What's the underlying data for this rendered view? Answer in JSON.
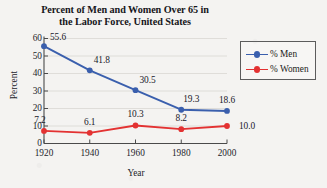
{
  "chart_data": {
    "type": "line",
    "title": "Percent of Men and Women Over 65 in the Labor Force, United States",
    "title_line1": "Percent of Men and Women Over 65 in",
    "title_line2": "the Labor Force, United States",
    "xlabel": "Year",
    "ylabel": "Percent",
    "categories": [
      1920,
      1940,
      1960,
      1980,
      2000
    ],
    "xtick_labels": [
      "1920",
      "1940",
      "1960",
      "1980",
      "2000"
    ],
    "ytick_labels": [
      "0",
      "10",
      "20",
      "30",
      "40",
      "50",
      "60"
    ],
    "ytick_values": [
      0,
      10,
      20,
      30,
      40,
      50,
      60
    ],
    "ylim": [
      0,
      60
    ],
    "xlim": [
      1920,
      2000
    ],
    "grid": "horizontal",
    "legend_position": "right",
    "series": [
      {
        "name": "% Men",
        "color": "#3a5fad",
        "values": [
          55.6,
          41.8,
          30.5,
          19.3,
          18.6
        ],
        "labels": [
          "55.6",
          "41.8",
          "30.5",
          "19.3",
          "18.6"
        ]
      },
      {
        "name": "% Women",
        "color": "#e33232",
        "values": [
          7.2,
          6.1,
          10.3,
          8.2,
          10.0
        ],
        "labels": [
          "7.2",
          "6.1",
          "10.3",
          "8.2",
          "10.0"
        ]
      }
    ]
  },
  "legend": {
    "items": [
      {
        "label": "% Men"
      },
      {
        "label": "% Women"
      }
    ]
  },
  "colors": {
    "men": "#3a5fad",
    "women": "#e33232",
    "axis": "#4a4a4a",
    "grid": "#d9d7d3",
    "background": "#f4f3f1"
  }
}
